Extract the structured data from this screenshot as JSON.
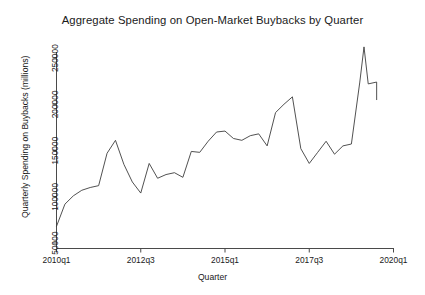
{
  "chart_data": {
    "type": "line",
    "title": "Aggregate Spending on Open-Market Buybacks by Quarter",
    "xlabel": "Quarter",
    "ylabel": "Quarterly Spending on Buybacks (millions)",
    "grid": false,
    "legend": "none",
    "line_color": "#3d3d3d",
    "ylim": [
      50000,
      262000
    ],
    "yticks": [
      50000,
      100000,
      150000,
      200000,
      250000
    ],
    "ytick_labels": [
      "50000",
      "100000",
      "150000",
      "200000",
      "250000"
    ],
    "xlim": [
      "2010q1",
      "2020q1"
    ],
    "xticks": [
      "2010q1",
      "2012q3",
      "2015q1",
      "2017q3",
      "2020q1"
    ],
    "xtick_labels": [
      "2010q1",
      "2012q3",
      "2015q1",
      "2017q3",
      "2020q1"
    ],
    "x": [
      "2010q1",
      "2010q2",
      "2010q3",
      "2010q4",
      "2011q1",
      "2011q2",
      "2011q3",
      "2011q4",
      "2012q1",
      "2012q2",
      "2012q3",
      "2012q4",
      "2013q1",
      "2013q2",
      "2013q3",
      "2013q4",
      "2014q1",
      "2014q2",
      "2014q3",
      "2014q4",
      "2015q1",
      "2015q2",
      "2015q3",
      "2015q4",
      "2016q1",
      "2016q2",
      "2016q3",
      "2016q4",
      "2017q1",
      "2017q2",
      "2017q3",
      "2017q4",
      "2018q1",
      "2018q2",
      "2018q3",
      "2018q4",
      "2019q1",
      "2019q2",
      "2019q3"
    ],
    "values": [
      68000,
      92000,
      101000,
      107000,
      110000,
      112000,
      147000,
      161000,
      135000,
      116000,
      104000,
      136000,
      120000,
      124000,
      126000,
      121000,
      149000,
      148000,
      160000,
      170000,
      171000,
      163000,
      161000,
      166000,
      168000,
      155000,
      191000,
      200000,
      208000,
      152000,
      136000,
      148000,
      160000,
      146000,
      155000,
      157000,
      224000,
      222000,
      224000
    ],
    "series_name": "Aggregate buyback spending",
    "annotations": {
      "peak_value": 262000,
      "peak_label": "2018 peak",
      "min_value": 68000
    }
  }
}
